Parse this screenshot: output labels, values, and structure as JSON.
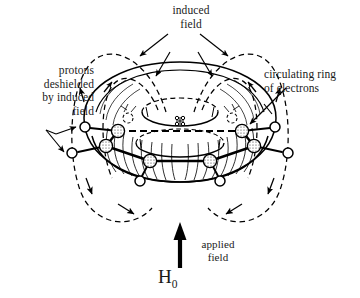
{
  "diagram": {
    "background_color": "#ffffff",
    "ink_color": "#000000",
    "labels": {
      "induced_field": "induced\nfield",
      "protons_deshielded": "protons\ndeshielded\nby induced\nfield",
      "circulating_ring": "circulating ring\nof electrons",
      "applied_field": "applied\nfield",
      "h0_symbol": "H",
      "h0_subscript": "0"
    },
    "elements": {
      "torus_name": "induced-field-torus",
      "ring_name": "benzene-ring",
      "carbon_count": 6,
      "hydrogen_count": 6,
      "field_loop_count": 4,
      "applied_field_arrow_direction": "up"
    }
  }
}
